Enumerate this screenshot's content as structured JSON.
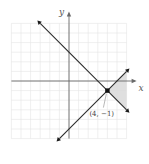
{
  "chart_data": {
    "type": "line",
    "title": "",
    "xlabel": "x",
    "ylabel": "y",
    "xlim": [
      -6,
      6
    ],
    "ylim": [
      -6,
      6
    ],
    "grid": true,
    "series": [
      {
        "name": "boundary-1",
        "equation": "y = -x + 3",
        "x": [
          -3,
          6
        ],
        "y": [
          6,
          -3
        ]
      },
      {
        "name": "boundary-2",
        "equation": "y = x - 5",
        "x": [
          -1,
          6
        ],
        "y": [
          -6,
          1
        ]
      }
    ],
    "shaded_region": {
      "description": "region to the right of the intersection, between the two lines",
      "vertices": [
        [
          4,
          -1
        ],
        [
          6,
          1
        ],
        [
          6,
          -3
        ]
      ],
      "color": "#d9d9d9"
    },
    "points": [
      {
        "x": 4,
        "y": -1,
        "label": "(4, −1)"
      }
    ],
    "annotations": [
      {
        "text": "(4, −1)",
        "target": [
          4,
          -1
        ]
      }
    ]
  }
}
